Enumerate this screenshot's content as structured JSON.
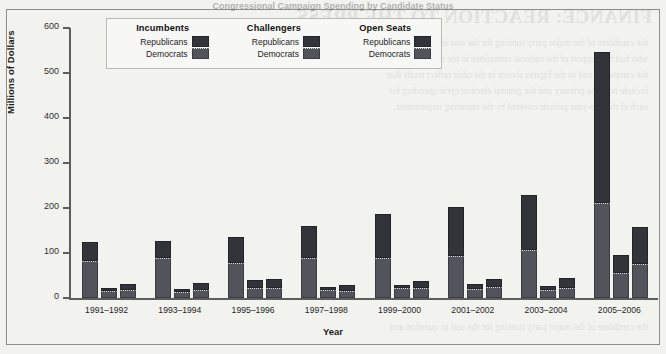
{
  "page": {
    "bleed_title": "FINANCE: REACTION TO THE PRESS",
    "bleed_lines": [
      "the candidate of the major party running for the seat in question and",
      "who had the support of the national committee in the closing weeks of",
      "the campaign, and so the figures shown in the table reflect totals that",
      "include both the primary and the general election cycle spending for",
      "each of the two-year periods covered by the reporting requirement."
    ]
  },
  "figure": {
    "title": "Congressional Campaign Spending by Candidate Status"
  },
  "legend": {
    "columns": [
      {
        "header": "Incumbents",
        "entries": [
          {
            "label": "Republicans",
            "swatch": "republicans-swatch"
          },
          {
            "label": "Democrats",
            "swatch": "democrats-swatch"
          }
        ]
      },
      {
        "header": "Challengers",
        "entries": [
          {
            "label": "Republicans",
            "swatch": "republicans-swatch"
          },
          {
            "label": "Democrats",
            "swatch": "democrats-swatch"
          }
        ]
      },
      {
        "header": "Open Seats",
        "entries": [
          {
            "label": "Republicans",
            "swatch": "republicans-swatch"
          },
          {
            "label": "Democrats",
            "swatch": "democrats-swatch"
          }
        ]
      }
    ]
  },
  "chart_data": {
    "type": "bar",
    "subtype": "grouped-stacked",
    "title": "",
    "xlabel": "Year",
    "ylabel": "Millions of Dollars",
    "ylim": [
      0,
      600
    ],
    "yticks": [
      0,
      100,
      200,
      300,
      400,
      500,
      600
    ],
    "ytick_labels": [
      "0",
      "100",
      "200",
      "300",
      "400",
      "500",
      "600"
    ],
    "grid": false,
    "legend_position": "top-left-inside",
    "colors": {
      "republicans": "#33333a",
      "democrats": "#53535b",
      "axis": "#5d5d5d",
      "background": "#f2f2ef",
      "legend_background": "#f7f7f5"
    },
    "categories": [
      "1991–1992",
      "1993–1994",
      "1995–1996",
      "1997–1998",
      "1999–2000",
      "2001–2002",
      "2003–2004",
      "2005–2006"
    ],
    "groups": [
      "Incumbents",
      "Challengers",
      "Open Seats"
    ],
    "stack_order": [
      "Democrats",
      "Republicans"
    ],
    "series": [
      {
        "name": "Incumbents – Democrats",
        "values": [
          83,
          88,
          77,
          88,
          88,
          93,
          106,
          211
        ]
      },
      {
        "name": "Incumbents – Republicans",
        "values": [
          42,
          38,
          58,
          72,
          98,
          110,
          124,
          336
        ]
      },
      {
        "name": "Challengers – Democrats",
        "values": [
          16,
          13,
          22,
          18,
          23,
          20,
          18,
          55
        ]
      },
      {
        "name": "Challengers – Republicans",
        "values": [
          7,
          6,
          18,
          6,
          6,
          11,
          9,
          40
        ]
      },
      {
        "name": "Open Seats – Democrats",
        "values": [
          18,
          18,
          22,
          16,
          22,
          24,
          22,
          76
        ]
      },
      {
        "name": "Open Seats – Republicans",
        "values": [
          14,
          16,
          20,
          13,
          16,
          19,
          22,
          82
        ]
      }
    ],
    "totals": {
      "Incumbents": [
        125,
        126,
        135,
        160,
        186,
        203,
        230,
        547
      ],
      "Challengers": [
        23,
        19,
        40,
        24,
        29,
        31,
        27,
        95
      ],
      "Open Seats": [
        32,
        34,
        42,
        29,
        38,
        43,
        44,
        158
      ]
    }
  }
}
